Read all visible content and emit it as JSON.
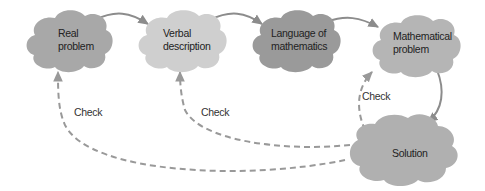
{
  "diagram": {
    "type": "flow",
    "colors": {
      "real_problem": "#a8a8a8",
      "verbal_description": "#cfcfcf",
      "language_of_mathematics": "#9a9a9a",
      "mathematical_problem": "#b5b5b5",
      "solution": "#b0b0b0",
      "arrow": "#8c8c8c",
      "dashed_arrow": "#999999"
    },
    "nodes": [
      {
        "id": "real_problem",
        "line1": "Real",
        "line2": "problem"
      },
      {
        "id": "verbal_description",
        "line1": "Verbal",
        "line2": "description"
      },
      {
        "id": "language_of_mathematics",
        "line1": "Language of",
        "line2": "mathematics"
      },
      {
        "id": "mathematical_problem",
        "line1": "Mathematical",
        "line2": "problem"
      },
      {
        "id": "solution",
        "line1": "Solution",
        "line2": ""
      }
    ],
    "edges": [
      {
        "from": "real_problem",
        "to": "verbal_description",
        "style": "solid"
      },
      {
        "from": "verbal_description",
        "to": "language_of_mathematics",
        "style": "solid"
      },
      {
        "from": "language_of_mathematics",
        "to": "mathematical_problem",
        "style": "solid"
      },
      {
        "from": "mathematical_problem",
        "to": "solution",
        "style": "solid"
      },
      {
        "from": "solution",
        "to": "real_problem",
        "style": "dashed",
        "label": "Check"
      },
      {
        "from": "solution",
        "to": "verbal_description",
        "style": "dashed",
        "label": "Check"
      },
      {
        "from": "solution",
        "to": "mathematical_problem",
        "style": "dashed",
        "label": "Check"
      }
    ]
  }
}
